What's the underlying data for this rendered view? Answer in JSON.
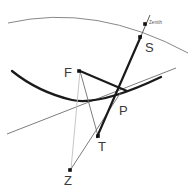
{
  "figure": {
    "type": "geometric-diagram",
    "width": 188,
    "height": 191,
    "background_color": "#ffffff",
    "stroke_colors": {
      "thick_black": "#1a1a1a",
      "thin_gray": "#6e6e6e",
      "light_gray": "#b9b9b9",
      "label_gray": "#3a3a3a"
    }
  },
  "labels": {
    "S": "S",
    "F": "F",
    "P": "P",
    "T": "T",
    "Z": "Z",
    "zenith": "Zenith"
  },
  "points": [
    {
      "name": "S",
      "label": "S",
      "x": 140,
      "y": 37,
      "label_x": 145,
      "label_y": 41,
      "marker": true
    },
    {
      "name": "F",
      "label": "F",
      "x": 79,
      "y": 71,
      "label_x": 64,
      "label_y": 66,
      "marker": true
    },
    {
      "name": "P",
      "label": "P",
      "x": 115,
      "y": 101,
      "label_x": 119,
      "label_y": 104,
      "marker": false
    },
    {
      "name": "T",
      "label": "T",
      "x": 98,
      "y": 136,
      "label_x": 98,
      "label_y": 140,
      "marker": true
    },
    {
      "name": "Z",
      "label": "Z",
      "x": 70,
      "y": 170,
      "label_x": 64,
      "label_y": 174,
      "marker": true
    },
    {
      "name": "zenith",
      "label": "Zenith",
      "x": 145,
      "y": 24,
      "label_x": 149,
      "label_y": 21,
      "marker": true
    }
  ],
  "curves": {
    "top_arc": {
      "name": "upper-arc",
      "path": "M 8 23 Q 96 3 188 53",
      "stroke": "#7a7a7a",
      "width": 0.9
    },
    "parabola": {
      "name": "parabola-curve",
      "path": "M 12 71 Q 38 92 72 100 Q 100 106 161 77",
      "stroke": "#1a1a1a",
      "width": 2.3
    }
  },
  "lines": [
    {
      "name": "tangent-line",
      "x1": 7,
      "y1": 134,
      "x2": 176,
      "y2": 68,
      "stroke": "#6e6e6e",
      "width": 0.9
    },
    {
      "name": "sight-line-S-T",
      "x1": 141,
      "y1": 36,
      "x2": 97,
      "y2": 137,
      "stroke": "#1a1a1a",
      "width": 2.2
    },
    {
      "name": "sight-line-upper",
      "x1": 141,
      "y1": 36,
      "x2": 150,
      "y2": 15,
      "stroke": "#4a4a4a",
      "width": 0.9
    },
    {
      "name": "chord-F-P",
      "x1": 80,
      "y1": 71,
      "x2": 127,
      "y2": 91,
      "stroke": "#1a1a1a",
      "width": 2.0
    },
    {
      "name": "chord-F-T",
      "x1": 80,
      "y1": 71,
      "x2": 98,
      "y2": 136,
      "stroke": "#6e6e6e",
      "width": 0.9
    },
    {
      "name": "chord-F-Z",
      "x1": 80,
      "y1": 71,
      "x2": 71,
      "y2": 169,
      "stroke": "#c0c0c0",
      "width": 0.9
    },
    {
      "name": "chord-Z-P",
      "x1": 71,
      "y1": 169,
      "x2": 121,
      "y2": 92,
      "stroke": "#6e6e6e",
      "width": 0.9
    }
  ]
}
